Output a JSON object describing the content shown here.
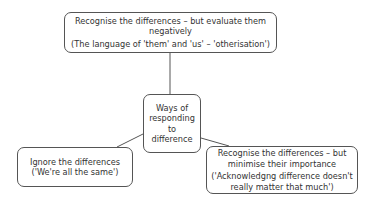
{
  "diagram": {
    "center": {
      "lines": [
        "Ways of",
        "responding",
        "to",
        "difference"
      ]
    },
    "top": {
      "lines": [
        "Recognise the differences – but evaluate them",
        "negatively"
      ],
      "note": "(The language of 'them' and 'us' – 'otherisation')"
    },
    "left": {
      "lines": [
        "Ignore the differences"
      ],
      "note": "('We're all the same')"
    },
    "right": {
      "lines": [
        "Recognise the differences  – but",
        "minimise their importance"
      ],
      "note_lines": [
        "('Acknowledgng difference doesn't",
        "really matter that much')"
      ]
    },
    "colors": {
      "border": "#555555",
      "text": "#333333",
      "connector": "#555555",
      "background": "#ffffff"
    }
  }
}
